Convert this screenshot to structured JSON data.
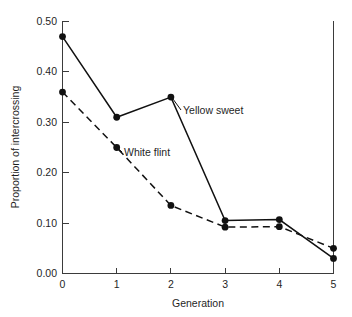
{
  "chart_data": {
    "type": "line",
    "title": "",
    "xlabel": "Generation",
    "ylabel": "Proportion of intercrossing",
    "x": [
      0,
      1,
      2,
      3,
      4,
      5
    ],
    "xlim": [
      0,
      5
    ],
    "ylim": [
      0.0,
      0.5
    ],
    "xticks": [
      "0",
      "1",
      "2",
      "3",
      "4",
      "5"
    ],
    "yticks": [
      "0.00",
      "0.10",
      "0.20",
      "0.30",
      "0.40",
      "0.50"
    ],
    "ytick_values": [
      0.0,
      0.1,
      0.2,
      0.3,
      0.4,
      0.5
    ],
    "grid": false,
    "legend_position": "inline-annotation",
    "series": [
      {
        "name": "Yellow sweet",
        "style": "solid",
        "marker": "filled-circle",
        "color": "#111111",
        "values": [
          0.47,
          0.31,
          0.35,
          0.105,
          0.107,
          0.03
        ]
      },
      {
        "name": "White flint",
        "style": "dashed",
        "marker": "filled-circle",
        "color": "#111111",
        "values": [
          0.36,
          0.25,
          0.135,
          0.092,
          0.093,
          0.05
        ]
      }
    ],
    "annotations": [
      {
        "text": "Yellow sweet",
        "x": 2.35,
        "y": 0.335
      },
      {
        "text": "White flint",
        "x": 1.25,
        "y": 0.225
      }
    ]
  },
  "labels": {
    "x_axis_title": "Generation",
    "y_axis_title": "Proportion of intercrossing",
    "series_yellow_sweet": "Yellow sweet",
    "series_white_flint": "White flint",
    "ytick_0": "0.00",
    "ytick_1": "0.10",
    "ytick_2": "0.20",
    "ytick_3": "0.30",
    "ytick_4": "0.40",
    "ytick_5": "0.50",
    "xtick_0": "0",
    "xtick_1": "1",
    "xtick_2": "2",
    "xtick_3": "3",
    "xtick_4": "4",
    "xtick_5": "5"
  }
}
